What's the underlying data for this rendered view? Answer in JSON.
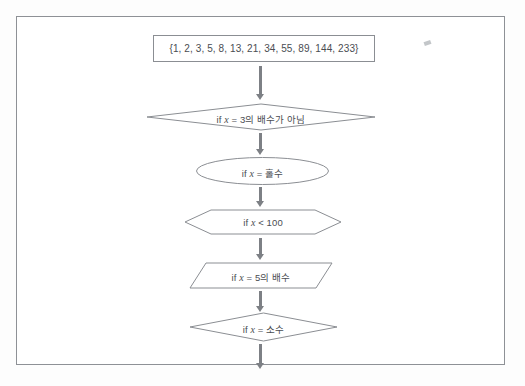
{
  "document": {
    "kind": "scanned-flowchart",
    "frame_border_color": "#8e9196",
    "shape_stroke_color": "#8b8e93",
    "text_color": "#4a4d52",
    "arrow_color": "#7d8085"
  },
  "flowchart": {
    "nodes": [
      {
        "id": "set-box",
        "shape": "rectangle",
        "text": "{1, 2, 3, 5, 8, 13, 21, 34, 55, 89, 144, 233}",
        "elements": []
      },
      {
        "id": "dec-mult3",
        "shape": "diamond",
        "prefix": "if ",
        "var": "x",
        "text": " = 3의 배수가 아님",
        "full_text": "if x = 3의 배수가 아님"
      },
      {
        "id": "ell-odd",
        "shape": "ellipse",
        "prefix": "if ",
        "var": "x",
        "text": " = 홀수",
        "full_text": "if x = 홀수"
      },
      {
        "id": "hex-lt100",
        "shape": "hexagon",
        "prefix": "if ",
        "var": "x",
        "text": " < 100",
        "full_text": "if x < 100"
      },
      {
        "id": "par-mult5",
        "shape": "parallelogram",
        "prefix": "if ",
        "var": "x",
        "text": " = 5의 배수",
        "full_text": "if x = 5의 배수"
      },
      {
        "id": "dec-prime",
        "shape": "diamond",
        "prefix": "if ",
        "var": "x",
        "text": " = 소수",
        "full_text": "if x = 소수"
      }
    ],
    "set_values": [
      1,
      2,
      3,
      5,
      8,
      13,
      21,
      34,
      55,
      89,
      144,
      233
    ],
    "arrows": [
      {
        "id": "arrow-1",
        "direction": "down"
      },
      {
        "id": "arrow-2",
        "direction": "down"
      },
      {
        "id": "arrow-3",
        "direction": "down"
      },
      {
        "id": "arrow-4",
        "direction": "down"
      },
      {
        "id": "arrow-5",
        "direction": "down"
      },
      {
        "id": "arrow-6",
        "direction": "down"
      }
    ]
  }
}
